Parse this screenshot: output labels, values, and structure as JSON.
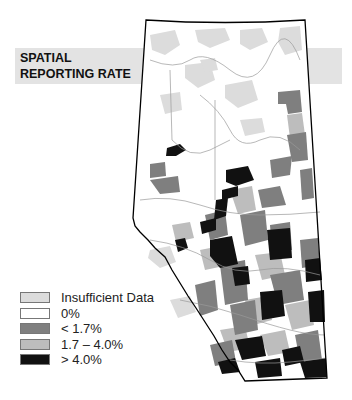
{
  "title": {
    "line1": "SPATIAL",
    "line2": "REPORTING RATE"
  },
  "legend": {
    "items": [
      {
        "label": "Insufficient Data",
        "color": "#dcdcdc"
      },
      {
        "label": "0%",
        "color": "#ffffff"
      },
      {
        "label": "< 1.7%",
        "color": "#7f7f7f"
      },
      {
        "label": "1.7 – 4.0%",
        "color": "#bdbdbd"
      },
      {
        "label": "> 4.0%",
        "color": "#111111"
      }
    ]
  },
  "map": {
    "region": "Alberta",
    "outline_color": "#000000"
  }
}
